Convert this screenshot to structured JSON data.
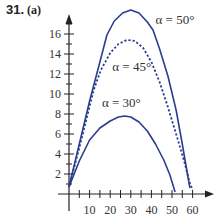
{
  "header": {
    "problem_number": "31.",
    "part": "(a)"
  },
  "colors": {
    "curve": "#2a3d8f",
    "axis": "#222222",
    "text": "#333333"
  },
  "chart_data": {
    "type": "line",
    "xlabel": "",
    "ylabel": "",
    "xlim": [
      0,
      63
    ],
    "ylim": [
      0,
      18.5
    ],
    "x_ticks": [
      10,
      20,
      30,
      40,
      50,
      60
    ],
    "x_minor_step": 5,
    "y_ticks": [
      2,
      4,
      6,
      8,
      10,
      12,
      14,
      16
    ],
    "y_minor_step": 1,
    "grid": false,
    "legend": "inline labels",
    "series": [
      {
        "name": "α = 50°",
        "style": "solid",
        "points": [
          [
            0,
            0.7
          ],
          [
            5,
            5.0
          ],
          [
            10,
            9.3
          ],
          [
            15,
            13.2
          ],
          [
            18.4,
            15.9
          ],
          [
            22,
            17.3
          ],
          [
            26,
            18.1
          ],
          [
            30,
            18.4
          ],
          [
            34,
            18.1
          ],
          [
            38,
            17.2
          ],
          [
            40.8,
            16.4
          ],
          [
            44,
            14.5
          ],
          [
            48,
            11.8
          ],
          [
            52,
            8.4
          ],
          [
            54.9,
            5.1
          ],
          [
            57,
            2.6
          ],
          [
            58.7,
            0.6
          ]
        ]
      },
      {
        "name": "α = 45°",
        "style": "dashed",
        "points": [
          [
            0,
            0.7
          ],
          [
            5,
            4.6
          ],
          [
            9.2,
            8.1
          ],
          [
            12,
            10.4
          ],
          [
            15.5,
            12.4
          ],
          [
            20,
            14.1
          ],
          [
            24,
            15.0
          ],
          [
            28,
            15.4
          ],
          [
            32,
            15.3
          ],
          [
            36,
            14.6
          ],
          [
            40,
            13.2
          ],
          [
            44,
            11.2
          ],
          [
            48,
            8.7
          ],
          [
            52,
            6.0
          ],
          [
            56,
            3.2
          ],
          [
            58.5,
            1.2
          ],
          [
            60,
            0.4
          ]
        ]
      },
      {
        "name": "α = 30°",
        "style": "solid",
        "points": [
          [
            0,
            0.7
          ],
          [
            5,
            3.3
          ],
          [
            10,
            5.4
          ],
          [
            15,
            6.6
          ],
          [
            20,
            7.3
          ],
          [
            24,
            7.7
          ],
          [
            27,
            7.8
          ],
          [
            30,
            7.7
          ],
          [
            34,
            7.2
          ],
          [
            38,
            6.3
          ],
          [
            42,
            5.0
          ],
          [
            46,
            3.4
          ],
          [
            49,
            1.9
          ],
          [
            51.5,
            0.2
          ]
        ]
      }
    ],
    "annotations": [
      {
        "text": "α = 50°",
        "x": 42,
        "y": 17
      },
      {
        "text": "α = 45°",
        "x": 21,
        "y": 12.3
      },
      {
        "text": "α = 30°",
        "x": 16,
        "y": 8.7
      }
    ]
  }
}
